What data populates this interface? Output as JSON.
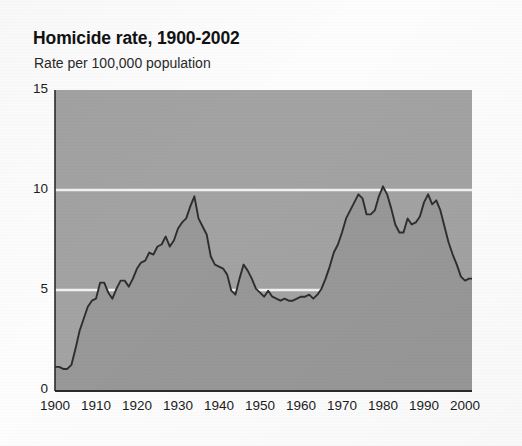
{
  "chart_data": {
    "type": "area",
    "title": "Homicide rate, 1900-2002",
    "subtitle": "Rate per 100,000 population",
    "xlabel": "",
    "ylabel": "Rate per 100,000 population",
    "ylim": [
      0,
      15
    ],
    "xlim": [
      1900,
      2002
    ],
    "yticks": [
      0,
      5,
      10,
      15
    ],
    "ytick_labels": [
      "0",
      "5",
      "10",
      "15"
    ],
    "xticks": [
      1900,
      1910,
      1920,
      1930,
      1940,
      1950,
      1960,
      1970,
      1980,
      1990,
      2000
    ],
    "xtick_labels": [
      "1900",
      "1910",
      "1920",
      "1930",
      "1940",
      "1950",
      "1960",
      "1970",
      "1980",
      "1990",
      "2000"
    ],
    "grid": "horizontal-white-lines-at-5-and-10",
    "legend": "none",
    "series_name": "Homicide rate",
    "fill_color": "#989898",
    "line_color": "#2e2e2e",
    "plot_background": "#a3a3a3",
    "x": [
      1900,
      1901,
      1902,
      1903,
      1904,
      1905,
      1906,
      1907,
      1908,
      1909,
      1910,
      1911,
      1912,
      1913,
      1914,
      1915,
      1916,
      1917,
      1918,
      1919,
      1920,
      1921,
      1922,
      1923,
      1924,
      1925,
      1926,
      1927,
      1928,
      1929,
      1930,
      1931,
      1932,
      1933,
      1934,
      1935,
      1936,
      1937,
      1938,
      1939,
      1940,
      1941,
      1942,
      1943,
      1944,
      1945,
      1946,
      1947,
      1948,
      1949,
      1950,
      1951,
      1952,
      1953,
      1954,
      1955,
      1956,
      1957,
      1958,
      1959,
      1960,
      1961,
      1962,
      1963,
      1964,
      1965,
      1966,
      1967,
      1968,
      1969,
      1970,
      1971,
      1972,
      1973,
      1974,
      1975,
      1976,
      1977,
      1978,
      1979,
      1980,
      1981,
      1982,
      1983,
      1984,
      1985,
      1986,
      1987,
      1988,
      1989,
      1990,
      1991,
      1992,
      1993,
      1994,
      1995,
      1996,
      1997,
      1998,
      1999,
      2000,
      2001,
      2002
    ],
    "values": [
      1.2,
      1.2,
      1.1,
      1.1,
      1.3,
      2.1,
      3.0,
      3.6,
      4.2,
      4.5,
      4.6,
      5.4,
      5.4,
      4.9,
      4.6,
      5.1,
      5.5,
      5.5,
      5.2,
      5.6,
      6.1,
      6.4,
      6.5,
      6.9,
      6.8,
      7.2,
      7.3,
      7.7,
      7.2,
      7.5,
      8.1,
      8.4,
      8.6,
      9.2,
      9.7,
      8.6,
      8.2,
      7.8,
      6.7,
      6.3,
      6.2,
      6.1,
      5.8,
      5.0,
      4.8,
      5.6,
      6.3,
      6.0,
      5.6,
      5.1,
      4.9,
      4.7,
      5.0,
      4.7,
      4.6,
      4.5,
      4.6,
      4.5,
      4.5,
      4.6,
      4.7,
      4.7,
      4.8,
      4.6,
      4.8,
      5.1,
      5.6,
      6.2,
      6.9,
      7.3,
      7.9,
      8.6,
      9.0,
      9.4,
      9.8,
      9.6,
      8.8,
      8.8,
      9.0,
      9.7,
      10.2,
      9.8,
      9.1,
      8.3,
      7.9,
      7.9,
      8.6,
      8.3,
      8.4,
      8.7,
      9.4,
      9.8,
      9.3,
      9.5,
      9.0,
      8.2,
      7.4,
      6.8,
      6.3,
      5.7,
      5.5,
      5.6,
      5.6
    ],
    "annotations": [
      {
        "label": "1900 low",
        "year": 1900,
        "value": 1.2
      },
      {
        "label": "1933-34 peak",
        "year": 1934,
        "value": 9.7
      },
      {
        "label": "late-1950s trough",
        "year": 1955,
        "value": 4.5
      },
      {
        "label": "1980 peak",
        "year": 1980,
        "value": 10.2
      },
      {
        "label": "1991 peak",
        "year": 1991,
        "value": 9.8
      },
      {
        "label": "2000 value",
        "year": 2000,
        "value": 5.5
      }
    ]
  }
}
